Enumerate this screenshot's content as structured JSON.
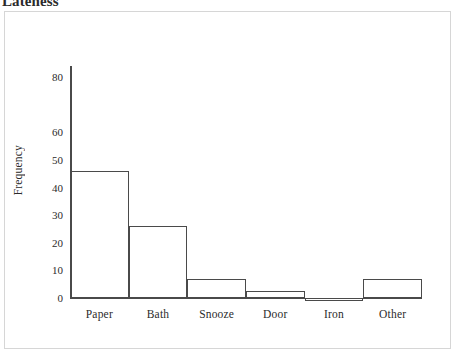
{
  "figure": {
    "title": "Lateness"
  },
  "chart_data": {
    "type": "bar",
    "title": "Lateness",
    "xlabel": "",
    "ylabel": "Frequency",
    "categories": [
      "Paper",
      "Bath",
      "Snooze",
      "Door",
      "Iron",
      "Other"
    ],
    "values": [
      46,
      26,
      7,
      2.5,
      -1,
      7
    ],
    "ylim": [
      -2,
      85
    ],
    "ytick_labels": [
      "0",
      "10",
      "20",
      "30",
      "40",
      "50",
      "60",
      "80"
    ],
    "ytick_values": [
      0,
      10,
      20,
      30,
      40,
      50,
      60,
      80
    ],
    "grid": false,
    "legend": "none",
    "bars_contiguous": true,
    "bar_fill": "none",
    "bar_outline_color": "#4a4a4a",
    "panel_border_color": "#d6d6d6",
    "background_color": "#ffffff"
  }
}
